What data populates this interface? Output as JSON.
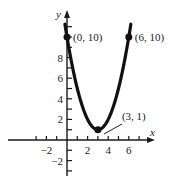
{
  "chart_data": {
    "type": "line",
    "title": "",
    "function": "y = (x - 3)^2 + 1",
    "xlabel": "x",
    "ylabel": "y",
    "xlim": [
      -3.5,
      8
    ],
    "ylim": [
      -3,
      11.5
    ],
    "x_ticks": [
      -2,
      2,
      4,
      6
    ],
    "y_ticks": [
      -2,
      2,
      4,
      6,
      8
    ],
    "grid": false,
    "series": [
      {
        "name": "parabola",
        "x": [
          -0.2,
          0,
          1,
          2,
          3,
          4,
          5,
          6,
          6.2
        ],
        "values": [
          11.24,
          10,
          5,
          2,
          1,
          2,
          5,
          10,
          11.24
        ]
      }
    ],
    "points": [
      {
        "x": 0,
        "y": 10,
        "label": "(0, 10)"
      },
      {
        "x": 6,
        "y": 10,
        "label": "(6, 10)"
      },
      {
        "x": 3,
        "y": 1,
        "label": "(3, 1)"
      }
    ],
    "color": "#111111"
  }
}
